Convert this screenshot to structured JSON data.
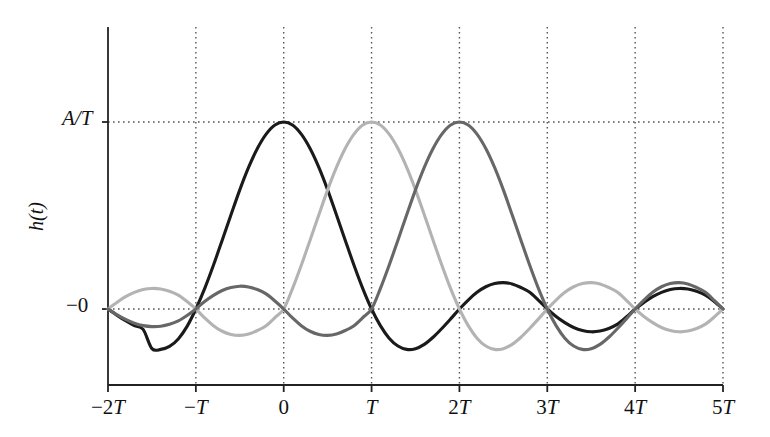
{
  "figure": {
    "background_color": "#ffffff",
    "width": 770,
    "height": 437
  },
  "axes": {
    "y_title": "h(t)",
    "y_tick_top_label": "A/T",
    "y_tick_zero_label": "−0",
    "x_tick_labels": [
      "−2T",
      "−T",
      "0",
      "T",
      "2T",
      "3T",
      "4T",
      "5T"
    ]
  },
  "chart_data": {
    "type": "line",
    "title": "",
    "subtitle": "",
    "xlabel": "",
    "ylabel": "h(t)",
    "xlim": [
      -2,
      5
    ],
    "ylim": [
      -0.33,
      1.08
    ],
    "x_ticks": [
      -2,
      -1,
      0,
      1,
      2,
      3,
      4,
      5
    ],
    "x_tick_labels": [
      "−2T",
      "−T",
      "0",
      "T",
      "2T",
      "3T",
      "4T",
      "5T"
    ],
    "y_ticks": [
      0,
      1
    ],
    "y_tick_labels": [
      "−0",
      "A/T"
    ],
    "grid": true,
    "grid_style": "dotted",
    "grid_color": "#555555",
    "legend": "none",
    "annotations": [],
    "series": [
      {
        "name": "sinc pulse centered at 0",
        "color": "#1a1a1a",
        "line_width": 3.1,
        "center": 0,
        "peak_value": 1.0,
        "peak_x": 0,
        "zero_crossings": [
          -2,
          -1,
          1,
          2,
          3,
          4,
          5
        ],
        "x": [
          -2.0,
          -1.9,
          -1.8,
          -1.7,
          -1.6,
          -1.5,
          -1.4,
          -1.3,
          -1.2,
          -1.1,
          -1.0,
          -0.9,
          -0.8,
          -0.7,
          -0.6,
          -0.5,
          -0.4,
          -0.3,
          -0.2,
          -0.1,
          0.0,
          0.1,
          0.2,
          0.3,
          0.4,
          0.5,
          0.6,
          0.7,
          0.8,
          0.9,
          1.0,
          1.1,
          1.2,
          1.3,
          1.4,
          1.5,
          1.6,
          1.7,
          1.8,
          1.9,
          2.0,
          2.1,
          2.2,
          2.3,
          2.4,
          2.5,
          2.6,
          2.7,
          2.8,
          2.9,
          3.0,
          3.1,
          3.2,
          3.3,
          3.4,
          3.5,
          3.6,
          3.7,
          3.8,
          3.9,
          4.0,
          4.1,
          4.2,
          4.3,
          4.4,
          4.5,
          4.6,
          4.7,
          4.8,
          4.9,
          5.0
        ],
        "values": [
          0.0,
          -0.033,
          -0.063,
          -0.089,
          -0.109,
          -0.212,
          -0.216,
          -0.2,
          -0.16,
          -0.093,
          0.0,
          0.109,
          0.234,
          0.368,
          0.504,
          0.637,
          0.757,
          0.858,
          0.935,
          0.984,
          1.0,
          0.984,
          0.935,
          0.858,
          0.757,
          0.637,
          0.504,
          0.368,
          0.234,
          0.109,
          0.0,
          -0.089,
          -0.156,
          -0.198,
          -0.216,
          -0.212,
          -0.189,
          -0.151,
          -0.104,
          -0.053,
          0.0,
          0.048,
          0.089,
          0.119,
          0.136,
          0.141,
          0.134,
          0.115,
          0.089,
          0.046,
          0.0,
          -0.04,
          -0.073,
          -0.099,
          -0.115,
          -0.122,
          -0.118,
          -0.104,
          -0.081,
          -0.043,
          0.0,
          0.035,
          0.066,
          0.089,
          0.104,
          0.11,
          0.107,
          0.095,
          0.074,
          0.04,
          0.0
        ]
      },
      {
        "name": "sinc pulse centered at T",
        "color": "#b3b3b3",
        "line_width": 3.1,
        "center": 1,
        "peak_value": 1.0,
        "peak_x": 1,
        "zero_crossings": [
          -2,
          -1,
          0,
          2,
          3,
          4,
          5
        ],
        "x": [
          -2.0,
          -1.9,
          -1.8,
          -1.7,
          -1.6,
          -1.5,
          -1.4,
          -1.3,
          -1.2,
          -1.1,
          -1.0,
          -0.9,
          -0.8,
          -0.7,
          -0.6,
          -0.5,
          -0.4,
          -0.3,
          -0.2,
          -0.1,
          0.0,
          0.1,
          0.2,
          0.3,
          0.4,
          0.5,
          0.6,
          0.7,
          0.8,
          0.9,
          1.0,
          1.1,
          1.2,
          1.3,
          1.4,
          1.5,
          1.6,
          1.7,
          1.8,
          1.9,
          2.0,
          2.1,
          2.2,
          2.3,
          2.4,
          2.5,
          2.6,
          2.7,
          2.8,
          2.9,
          3.0,
          3.1,
          3.2,
          3.3,
          3.4,
          3.5,
          3.6,
          3.7,
          3.8,
          3.9,
          4.0,
          4.1,
          4.2,
          4.3,
          4.4,
          4.5,
          4.6,
          4.7,
          4.8,
          4.9,
          5.0
        ],
        "values": [
          0.0,
          0.035,
          0.066,
          0.089,
          0.104,
          0.11,
          0.107,
          0.095,
          0.074,
          0.04,
          0.0,
          -0.048,
          -0.089,
          -0.119,
          -0.136,
          -0.141,
          -0.134,
          -0.115,
          -0.089,
          -0.046,
          0.0,
          0.109,
          0.234,
          0.368,
          0.504,
          0.637,
          0.757,
          0.858,
          0.935,
          0.984,
          1.0,
          0.984,
          0.935,
          0.858,
          0.757,
          0.637,
          0.504,
          0.368,
          0.234,
          0.109,
          0.0,
          -0.089,
          -0.156,
          -0.198,
          -0.216,
          -0.212,
          -0.189,
          -0.151,
          -0.104,
          -0.053,
          0.0,
          0.048,
          0.089,
          0.119,
          0.136,
          0.141,
          0.134,
          0.115,
          0.089,
          0.046,
          0.0,
          -0.04,
          -0.073,
          -0.099,
          -0.115,
          -0.122,
          -0.118,
          -0.104,
          -0.081,
          -0.043,
          0.0
        ]
      },
      {
        "name": "sinc pulse centered at 2T",
        "color": "#676767",
        "line_width": 3.1,
        "center": 2,
        "peak_value": 1.0,
        "peak_x": 2,
        "zero_crossings": [
          -2,
          -1,
          0,
          1,
          3,
          4,
          5
        ],
        "x": [
          -2.0,
          -1.9,
          -1.8,
          -1.7,
          -1.6,
          -1.5,
          -1.4,
          -1.3,
          -1.2,
          -1.1,
          -1.0,
          -0.9,
          -0.8,
          -0.7,
          -0.6,
          -0.5,
          -0.4,
          -0.3,
          -0.2,
          -0.1,
          0.0,
          0.1,
          0.2,
          0.3,
          0.4,
          0.5,
          0.6,
          0.7,
          0.8,
          0.9,
          1.0,
          1.1,
          1.2,
          1.3,
          1.4,
          1.5,
          1.6,
          1.7,
          1.8,
          1.9,
          2.0,
          2.1,
          2.2,
          2.3,
          2.4,
          2.5,
          2.6,
          2.7,
          2.8,
          2.9,
          3.0,
          3.1,
          3.2,
          3.3,
          3.4,
          3.5,
          3.6,
          3.7,
          3.8,
          3.9,
          4.0,
          4.1,
          4.2,
          4.3,
          4.4,
          4.5,
          4.6,
          4.7,
          4.8,
          4.9,
          5.0
        ],
        "values": [
          0.0,
          -0.03,
          -0.056,
          -0.076,
          -0.089,
          -0.094,
          -0.092,
          -0.082,
          -0.064,
          -0.035,
          0.0,
          0.04,
          0.073,
          0.099,
          0.115,
          0.122,
          0.118,
          0.104,
          0.081,
          0.043,
          0.0,
          -0.048,
          -0.089,
          -0.119,
          -0.136,
          -0.141,
          -0.134,
          -0.115,
          -0.089,
          -0.046,
          0.0,
          0.109,
          0.234,
          0.368,
          0.504,
          0.637,
          0.757,
          0.858,
          0.935,
          0.984,
          1.0,
          0.984,
          0.935,
          0.858,
          0.757,
          0.637,
          0.504,
          0.368,
          0.234,
          0.109,
          0.0,
          -0.089,
          -0.156,
          -0.198,
          -0.216,
          -0.212,
          -0.189,
          -0.151,
          -0.104,
          -0.053,
          0.0,
          0.048,
          0.089,
          0.119,
          0.136,
          0.141,
          0.134,
          0.115,
          0.089,
          0.046,
          0.0
        ]
      }
    ]
  }
}
